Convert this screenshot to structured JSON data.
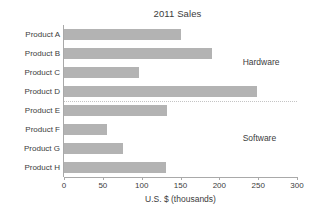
{
  "chart_data": {
    "type": "bar",
    "orientation": "horizontal",
    "title": "2011 Sales",
    "xlabel": "U.S. $ (thousands)",
    "ylabel": "",
    "categories": [
      "Product A",
      "Product B",
      "Product C",
      "Product D",
      "Product E",
      "Product F",
      "Product G",
      "Product H"
    ],
    "values": [
      150,
      190,
      97,
      248,
      133,
      55,
      76,
      131
    ],
    "xlim": [
      0,
      300
    ],
    "xticks": [
      0,
      50,
      100,
      150,
      200,
      250,
      300
    ],
    "xtick_labels": [
      "0",
      "50",
      "100",
      "150",
      "200",
      "250",
      "300"
    ],
    "grid": false,
    "legend": "none",
    "bar_color": "#b3b3b3",
    "axis_color": "#a9a9a9",
    "text_color": "#3c3c3c",
    "annotations": [
      {
        "text": "Hardware",
        "group_categories": [
          "Product A",
          "Product B",
          "Product C",
          "Product D"
        ]
      },
      {
        "text": "Software",
        "group_categories": [
          "Product E",
          "Product F",
          "Product G",
          "Product H"
        ]
      }
    ],
    "separator": {
      "after_category": "Product D",
      "style": "dotted"
    }
  }
}
